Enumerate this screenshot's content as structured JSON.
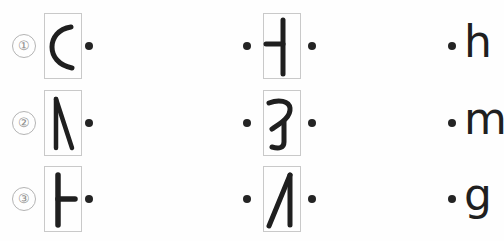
{
  "sheet": {
    "title": "Handwritten glyph sequence sheet",
    "background_color": "#fefefe",
    "ink_color": "#1f1f1f",
    "box_border_color": "#c9c9c9",
    "index_color": "#8d8d8d",
    "dot_color": "#242424"
  },
  "rows": [
    {
      "index_label": "①",
      "col1": {
        "glyph_name": "c-curve-stroke",
        "glyph_text": "C",
        "boxed": true,
        "dot_after": "•"
      },
      "col2": {
        "glyph_name": "vertical-bar-with-left-tick-stroke",
        "glyph_text": "⊣",
        "boxed": true,
        "dot_before": "•",
        "dot_after": "•"
      },
      "col3": {
        "dot_before": "•",
        "letter": "h"
      }
    },
    {
      "index_label": "②",
      "col1": {
        "glyph_name": "inverted-v-stroke",
        "glyph_text": "Λ",
        "boxed": true,
        "dot_after": "•"
      },
      "col2": {
        "glyph_name": "hooked-angle-stroke",
        "glyph_text": "ㄱ",
        "boxed": true,
        "dot_before": "•",
        "dot_after": "•"
      },
      "col3": {
        "dot_before": "•",
        "letter": "m"
      }
    },
    {
      "index_label": "③",
      "col1": {
        "glyph_name": "vertical-bar-with-right-tick-stroke",
        "glyph_text": "⊢",
        "boxed": true,
        "dot_after": "•"
      },
      "col2": {
        "glyph_name": "slanted-caret-stroke",
        "glyph_text": "ᐱ",
        "boxed": true,
        "dot_before": "•",
        "dot_after": "•"
      },
      "col3": {
        "dot_before": "•",
        "letter": "g"
      }
    }
  ]
}
